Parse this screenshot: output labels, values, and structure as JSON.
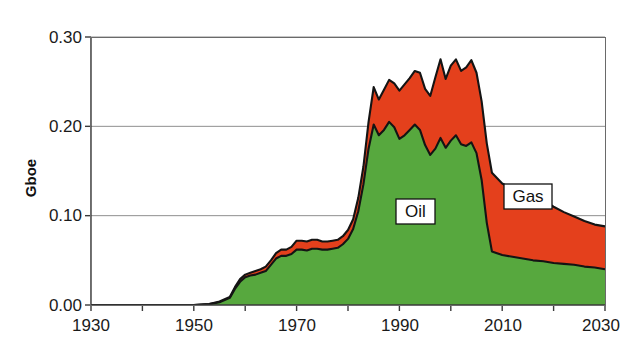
{
  "chart_data": {
    "type": "area",
    "stacked": true,
    "title": "",
    "subtitle": "",
    "xlabel": "",
    "ylabel": "Gboe",
    "xlim": [
      1930,
      2030
    ],
    "ylim": [
      0.0,
      0.3
    ],
    "xticks": [
      1930,
      1950,
      1970,
      1990,
      2010,
      2030
    ],
    "xtick_labels": [
      "1930",
      "1950",
      "1970",
      "1990",
      "2010",
      "2030"
    ],
    "minor_xtick_interval": 10,
    "yticks": [
      0.0,
      0.1,
      0.2,
      0.3
    ],
    "ytick_labels": [
      "0.00",
      "0.10",
      "0.20",
      "0.30"
    ],
    "grid": "horizontal",
    "legend": "inline-annotations",
    "annotations": [
      {
        "text": "Oil",
        "x": 1988,
        "y": 0.115,
        "boxed": true
      },
      {
        "text": "Gas",
        "x": 2009,
        "y": 0.135,
        "boxed": true
      }
    ],
    "colors": {
      "oil": "#57a83e",
      "gas": "#e4401c",
      "outline": "#141414",
      "grid": "#8f8f8f",
      "axis": "#3a3a3a",
      "frame": "#4a4a4a",
      "text": "#1a1a1a",
      "background": "#ffffff"
    },
    "x": [
      1930,
      1935,
      1940,
      1945,
      1950,
      1953,
      1955,
      1957,
      1958,
      1959,
      1960,
      1961,
      1962,
      1963,
      1964,
      1965,
      1966,
      1967,
      1968,
      1969,
      1970,
      1971,
      1972,
      1973,
      1974,
      1975,
      1976,
      1977,
      1978,
      1979,
      1980,
      1981,
      1982,
      1983,
      1984,
      1985,
      1986,
      1987,
      1988,
      1989,
      1990,
      1991,
      1992,
      1993,
      1994,
      1995,
      1996,
      1997,
      1998,
      1999,
      2000,
      2001,
      2002,
      2003,
      2004,
      2005,
      2006,
      2007,
      2008,
      2010,
      2012,
      2014,
      2016,
      2018,
      2020,
      2022,
      2024,
      2026,
      2028,
      2030
    ],
    "series": [
      {
        "name": "Oil",
        "color": "#57a83e",
        "values": [
          0.0,
          0.0,
          0.0,
          0.0,
          0.0,
          0.001,
          0.003,
          0.008,
          0.018,
          0.026,
          0.031,
          0.033,
          0.034,
          0.036,
          0.038,
          0.045,
          0.052,
          0.055,
          0.055,
          0.057,
          0.062,
          0.062,
          0.061,
          0.063,
          0.063,
          0.062,
          0.062,
          0.063,
          0.064,
          0.068,
          0.074,
          0.085,
          0.105,
          0.135,
          0.175,
          0.202,
          0.19,
          0.196,
          0.205,
          0.199,
          0.186,
          0.19,
          0.196,
          0.202,
          0.196,
          0.179,
          0.168,
          0.175,
          0.187,
          0.176,
          0.184,
          0.19,
          0.18,
          0.178,
          0.182,
          0.17,
          0.14,
          0.092,
          0.06,
          0.056,
          0.054,
          0.052,
          0.05,
          0.049,
          0.047,
          0.046,
          0.045,
          0.043,
          0.042,
          0.04
        ]
      },
      {
        "name": "Gas",
        "color": "#e4401c",
        "values": [
          0.0,
          0.0,
          0.0,
          0.0,
          0.0,
          0.0,
          0.001,
          0.001,
          0.002,
          0.003,
          0.003,
          0.003,
          0.004,
          0.004,
          0.005,
          0.005,
          0.006,
          0.007,
          0.007,
          0.008,
          0.01,
          0.01,
          0.01,
          0.01,
          0.01,
          0.009,
          0.009,
          0.009,
          0.009,
          0.009,
          0.01,
          0.011,
          0.015,
          0.02,
          0.03,
          0.042,
          0.04,
          0.045,
          0.047,
          0.049,
          0.054,
          0.057,
          0.058,
          0.06,
          0.064,
          0.063,
          0.066,
          0.08,
          0.088,
          0.077,
          0.084,
          0.085,
          0.082,
          0.088,
          0.092,
          0.09,
          0.088,
          0.089,
          0.088,
          0.08,
          0.076,
          0.075,
          0.073,
          0.068,
          0.063,
          0.058,
          0.054,
          0.051,
          0.048,
          0.048
        ]
      }
    ],
    "totals_note": "Oil + Gas stacked; total peaks near 0.278 around 2004"
  }
}
